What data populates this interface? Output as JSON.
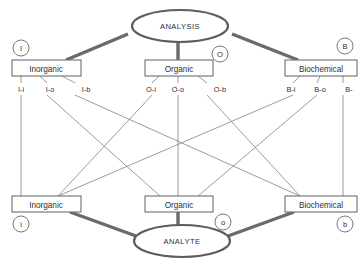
{
  "diagram": {
    "title_top": "ANALYSIS",
    "title_bottom": "ANALYTE",
    "top_nodes": [
      {
        "label": "Inorganic",
        "tag": "I"
      },
      {
        "label": "Organic",
        "tag": "O"
      },
      {
        "label": "Biochemical",
        "tag": "B"
      }
    ],
    "bottom_nodes": [
      {
        "label": "Inorganic",
        "tag": "i"
      },
      {
        "label": "Organic",
        "tag": "o"
      },
      {
        "label": "Biochemical",
        "tag": "b"
      }
    ],
    "edge_labels": [
      "I-i",
      "I-o",
      "I-b",
      "O-i",
      "O-o",
      "O-b",
      "B-i",
      "B-o",
      "B-"
    ],
    "colors": {
      "trunk": "#6a6a6a",
      "thin_edge": "#8a8a8a",
      "box_stroke": "#6e6e6e",
      "text": "#2f2f2f",
      "background": "#ffffff"
    }
  }
}
